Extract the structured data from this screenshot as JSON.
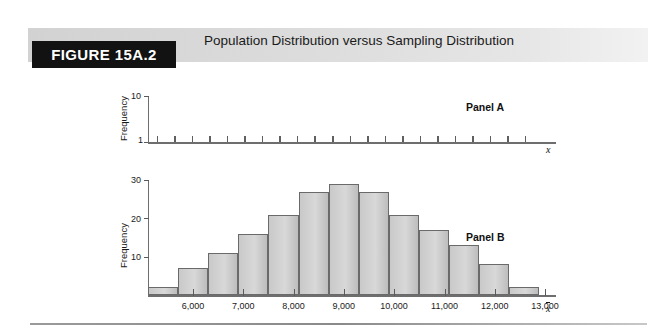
{
  "figure": {
    "badge_label": "FIGURE 15A.2",
    "title": "Population Distribution versus Sampling Distribution"
  },
  "panel_a": {
    "tag": "Panel A",
    "y_axis_label": "Frequency",
    "y_ticks": [
      "1",
      "10"
    ],
    "x_axis_var": "x"
  },
  "panel_b": {
    "tag": "Panel B",
    "y_axis_label": "Frequency",
    "y_ticks": [
      "10",
      "20",
      "30"
    ],
    "x_axis_var": "x",
    "x_tick_labels": [
      "6,000",
      "7,000",
      "8,000",
      "9,000",
      "10,000",
      "11,000",
      "12,000",
      "13,000"
    ]
  },
  "chart_data": [
    {
      "type": "bar",
      "title": "Panel A",
      "subtitle": "Population Distribution",
      "xlabel": "x",
      "ylabel": "Frequency",
      "ylim": [
        1,
        10
      ],
      "y_tick_values": [
        1,
        10
      ],
      "grid": false,
      "legend": "none",
      "note": "Flat (uniform) population distribution: every value occurs with frequency 1",
      "categories": [
        "1",
        "2",
        "3",
        "4",
        "5",
        "6",
        "7",
        "8",
        "9",
        "10",
        "11",
        "12",
        "13",
        "14",
        "15",
        "16",
        "17",
        "18",
        "19",
        "20",
        "21",
        "22"
      ],
      "values": [
        1,
        1,
        1,
        1,
        1,
        1,
        1,
        1,
        1,
        1,
        1,
        1,
        1,
        1,
        1,
        1,
        1,
        1,
        1,
        1,
        1,
        1
      ]
    },
    {
      "type": "bar",
      "title": "Panel B",
      "subtitle": "Sampling Distribution of the sample mean",
      "xlabel": "x",
      "ylabel": "Frequency",
      "ylim": [
        0,
        30
      ],
      "y_tick_values": [
        10,
        20,
        30
      ],
      "xlim": [
        5500,
        13500
      ],
      "x_tick_values": [
        6000,
        7000,
        8000,
        9000,
        10000,
        11000,
        12000,
        13000
      ],
      "grid": false,
      "legend": "none",
      "categories": [
        "5,500",
        "6,000",
        "6,500",
        "7,000",
        "7,500",
        "8,000",
        "8,500",
        "9,000",
        "9,500",
        "10,000",
        "10,500",
        "11,000",
        "11,500",
        "12,000",
        "13,000"
      ],
      "bin_centers": [
        5750,
        6250,
        6750,
        7250,
        7750,
        8250,
        8750,
        9250,
        9750,
        10250,
        10750,
        11250,
        12000,
        13000
      ],
      "values": [
        2,
        7,
        11,
        16,
        21,
        27,
        29,
        27,
        21,
        17,
        13,
        8,
        2
      ]
    }
  ],
  "colors": {
    "badge_background": "#121212",
    "badge_text": "#ffffff",
    "header_band_left": "#d2d2d2",
    "header_band_right": "#f2f2f2",
    "bar_fill": "#d0d0d0",
    "bar_stroke": "#6a6a6a",
    "axis": "#6e6e6e",
    "text": "#1a1a1a"
  }
}
